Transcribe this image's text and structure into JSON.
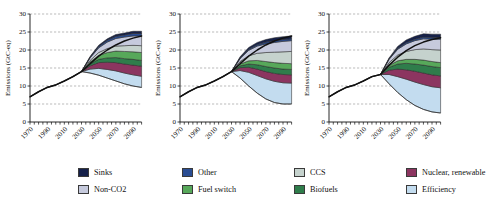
{
  "chart_data": [
    {
      "type": "area",
      "panel": 1,
      "title": "",
      "xlabel": "",
      "ylabel": "Emissions (GtC-eq)",
      "ylim": [
        0,
        30
      ],
      "yticks": [
        0,
        5,
        10,
        15,
        20,
        25,
        30
      ],
      "xlim": [
        1970,
        2100
      ],
      "xticks": [
        1970,
        1990,
        2010,
        2030,
        2050,
        2070,
        2090
      ],
      "grid": true,
      "legend_position": "bottom",
      "x": [
        1970,
        1980,
        1990,
        2000,
        2010,
        2020,
        2030,
        2040,
        2050,
        2060,
        2070,
        2080,
        2090,
        2100
      ],
      "historical": [
        7.0,
        8.4,
        9.6,
        10.3,
        11.4,
        12.6,
        14.0,
        null,
        null,
        null,
        null,
        null,
        null,
        null
      ],
      "baseline": [
        7.0,
        8.4,
        9.6,
        10.3,
        11.4,
        12.6,
        14.0,
        16.2,
        18.3,
        20.0,
        21.4,
        22.5,
        23.3,
        23.9
      ],
      "stack_bottom": [
        null,
        null,
        null,
        null,
        null,
        null,
        14.0,
        13.6,
        13.0,
        12.2,
        11.4,
        10.6,
        10.0,
        9.6
      ],
      "series": [
        {
          "name": "Efficiency",
          "values": [
            null,
            null,
            null,
            null,
            null,
            null,
            0.0,
            1.1,
            1.9,
            2.4,
            2.8,
            3.0,
            3.1,
            3.1
          ]
        },
        {
          "name": "Nuclear, renewable",
          "values": [
            null,
            null,
            null,
            null,
            null,
            null,
            0.0,
            0.9,
            1.6,
            2.0,
            2.3,
            2.5,
            2.7,
            2.8
          ]
        },
        {
          "name": "Biofuels",
          "values": [
            null,
            null,
            null,
            null,
            null,
            null,
            0.0,
            0.5,
            0.9,
            1.2,
            1.4,
            1.5,
            1.6,
            1.6
          ]
        },
        {
          "name": "Fuel switch",
          "values": [
            null,
            null,
            null,
            null,
            null,
            null,
            0.0,
            0.6,
            1.1,
            1.5,
            1.8,
            2.0,
            2.1,
            2.2
          ]
        },
        {
          "name": "CCS",
          "values": [
            null,
            null,
            null,
            null,
            null,
            null,
            0.0,
            0.4,
            0.8,
            1.1,
            1.4,
            1.6,
            1.8,
            1.9
          ]
        },
        {
          "name": "Non-CO2",
          "values": [
            null,
            null,
            null,
            null,
            null,
            null,
            0.0,
            0.7,
            1.3,
            1.8,
            2.1,
            2.4,
            2.6,
            2.7
          ]
        },
        {
          "name": "Other",
          "values": [
            null,
            null,
            null,
            null,
            null,
            null,
            0.0,
            0.2,
            0.4,
            0.5,
            0.6,
            0.6,
            0.7,
            0.7
          ]
        },
        {
          "name": "Sinks",
          "values": [
            null,
            null,
            null,
            null,
            null,
            null,
            0.0,
            0.2,
            0.3,
            0.4,
            0.5,
            0.5,
            0.6,
            0.6
          ]
        }
      ]
    },
    {
      "type": "area",
      "panel": 2,
      "title": "",
      "xlabel": "",
      "ylabel": "Emissions (GtC-eq)",
      "ylim": [
        0,
        30
      ],
      "yticks": [
        0,
        5,
        10,
        15,
        20,
        25,
        30
      ],
      "xlim": [
        1970,
        2100
      ],
      "xticks": [
        1970,
        1990,
        2010,
        2030,
        2050,
        2070,
        2090
      ],
      "grid": true,
      "legend_position": "bottom",
      "x": [
        1970,
        1980,
        1990,
        2000,
        2010,
        2020,
        2030,
        2040,
        2050,
        2060,
        2070,
        2080,
        2090,
        2100
      ],
      "historical": [
        7.0,
        8.4,
        9.6,
        10.3,
        11.4,
        12.6,
        14.0,
        null,
        null,
        null,
        null,
        null,
        null,
        null
      ],
      "baseline": [
        7.0,
        8.4,
        9.6,
        10.3,
        11.4,
        12.6,
        14.0,
        16.2,
        18.3,
        20.0,
        21.4,
        22.5,
        23.3,
        23.9
      ],
      "stack_bottom": [
        null,
        null,
        null,
        null,
        null,
        null,
        14.0,
        12.2,
        10.0,
        8.0,
        6.4,
        5.4,
        5.0,
        5.0
      ],
      "series": [
        {
          "name": "Efficiency",
          "values": [
            null,
            null,
            null,
            null,
            null,
            null,
            0.0,
            2.1,
            3.8,
            4.9,
            5.6,
            5.9,
            5.9,
            5.8
          ]
        },
        {
          "name": "Nuclear, renewable",
          "values": [
            null,
            null,
            null,
            null,
            null,
            null,
            0.0,
            0.8,
            1.4,
            1.8,
            2.0,
            2.2,
            2.3,
            2.3
          ]
        },
        {
          "name": "Biofuels",
          "values": [
            null,
            null,
            null,
            null,
            null,
            null,
            0.0,
            0.5,
            0.9,
            1.2,
            1.4,
            1.5,
            1.5,
            1.5
          ]
        },
        {
          "name": "Fuel switch",
          "values": [
            null,
            null,
            null,
            null,
            null,
            null,
            0.0,
            0.5,
            0.9,
            1.2,
            1.4,
            1.5,
            1.6,
            1.6
          ]
        },
        {
          "name": "CCS",
          "values": [
            null,
            null,
            null,
            null,
            null,
            null,
            0.0,
            0.7,
            1.4,
            2.0,
            2.5,
            2.9,
            3.2,
            3.4
          ]
        },
        {
          "name": "Non-CO2",
          "values": [
            null,
            null,
            null,
            null,
            null,
            null,
            0.0,
            0.8,
            1.5,
            2.0,
            2.4,
            2.7,
            2.9,
            3.0
          ]
        },
        {
          "name": "Other",
          "values": [
            null,
            null,
            null,
            null,
            null,
            null,
            0.0,
            0.2,
            0.3,
            0.4,
            0.5,
            0.5,
            0.5,
            0.5
          ]
        },
        {
          "name": "Sinks",
          "values": [
            null,
            null,
            null,
            null,
            null,
            null,
            0.0,
            0.3,
            0.5,
            0.6,
            0.7,
            0.8,
            0.8,
            0.8
          ]
        }
      ]
    },
    {
      "type": "area",
      "panel": 3,
      "title": "",
      "xlabel": "",
      "ylabel": "Emissions (GtC-eq)",
      "ylim": [
        0,
        30
      ],
      "yticks": [
        0,
        5,
        10,
        15,
        20,
        25,
        30
      ],
      "xlim": [
        1970,
        2100
      ],
      "xticks": [
        1970,
        1990,
        2010,
        2030,
        2050,
        2070,
        2090
      ],
      "grid": true,
      "legend_position": "bottom",
      "x": [
        1970,
        1980,
        1990,
        2000,
        2010,
        2020,
        2030,
        2040,
        2050,
        2060,
        2070,
        2080,
        2090,
        2100
      ],
      "historical": [
        7.0,
        8.4,
        9.6,
        10.3,
        11.4,
        12.6,
        13.2,
        null,
        null,
        null,
        null,
        null,
        null,
        null
      ],
      "baseline": [
        7.0,
        8.4,
        9.6,
        10.3,
        11.4,
        12.6,
        13.2,
        15.8,
        18.0,
        19.8,
        21.2,
        22.2,
        22.9,
        23.4
      ],
      "stack_bottom": [
        null,
        null,
        null,
        null,
        null,
        null,
        13.2,
        10.6,
        8.2,
        6.2,
        4.6,
        3.5,
        2.8,
        2.5
      ],
      "series": [
        {
          "name": "Efficiency",
          "values": [
            null,
            null,
            null,
            null,
            null,
            null,
            0.0,
            2.6,
            4.4,
            5.7,
            6.5,
            6.9,
            7.0,
            7.0
          ]
        },
        {
          "name": "Nuclear, renewable",
          "values": [
            null,
            null,
            null,
            null,
            null,
            null,
            0.0,
            1.2,
            2.1,
            2.6,
            3.0,
            3.2,
            3.3,
            3.3
          ]
        },
        {
          "name": "Biofuels",
          "values": [
            null,
            null,
            null,
            null,
            null,
            null,
            0.0,
            0.8,
            1.4,
            1.8,
            2.0,
            2.2,
            2.3,
            2.3
          ]
        },
        {
          "name": "Fuel switch",
          "values": [
            null,
            null,
            null,
            null,
            null,
            null,
            0.0,
            0.5,
            0.9,
            1.1,
            1.3,
            1.4,
            1.4,
            1.4
          ]
        },
        {
          "name": "CCS",
          "values": [
            null,
            null,
            null,
            null,
            null,
            null,
            0.0,
            0.8,
            1.6,
            2.2,
            2.7,
            3.1,
            3.3,
            3.5
          ]
        },
        {
          "name": "Non-CO2",
          "values": [
            null,
            null,
            null,
            null,
            null,
            null,
            0.0,
            0.9,
            1.6,
            2.1,
            2.5,
            2.8,
            2.9,
            3.0
          ]
        },
        {
          "name": "Other",
          "values": [
            null,
            null,
            null,
            null,
            null,
            null,
            0.0,
            0.2,
            0.3,
            0.4,
            0.4,
            0.5,
            0.5,
            0.5
          ]
        },
        {
          "name": "Sinks",
          "values": [
            null,
            null,
            null,
            null,
            null,
            null,
            0.0,
            0.2,
            0.5,
            0.7,
            0.8,
            0.9,
            0.9,
            0.9
          ]
        }
      ]
    }
  ],
  "axis": {
    "ylabel": "Emissions (GtC-eq)",
    "yticks": [
      "0",
      "5",
      "10",
      "15",
      "20",
      "25",
      "30"
    ],
    "xticks": [
      "1970",
      "1990",
      "2010",
      "2030",
      "2050",
      "2070",
      "2090"
    ]
  },
  "legend": {
    "items": [
      {
        "label": "Sinks",
        "color": "#16214a"
      },
      {
        "label": "Other",
        "color": "#2a4d93"
      },
      {
        "label": "CCS",
        "color": "#c5d2cd"
      },
      {
        "label": "Nuclear, renewable",
        "color": "#8c3560"
      },
      {
        "label": "Non-CO2",
        "color": "#c6cadd"
      },
      {
        "label": "Fuel switch",
        "color": "#57a85a"
      },
      {
        "label": "Biofuels",
        "color": "#2f7d4b"
      },
      {
        "label": "Efficiency",
        "color": "#c3dcef"
      }
    ]
  },
  "colors": {
    "historical_line": "#111111",
    "baseline_line": "#111111",
    "grid": "#8f8f8f",
    "axis": "#111111",
    "background": "#ffffff"
  }
}
